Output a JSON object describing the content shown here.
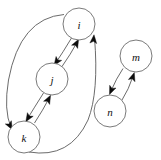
{
  "figure": {
    "kind": "directed-graph",
    "background_color": "#ffffff",
    "edge_color": "#5a5a5a",
    "arrow_color": "#0d0d0d",
    "node_fill": "#ffffff",
    "node_stroke": "#6b6b6b",
    "label_color": "#111111",
    "node_radius": 16
  },
  "nodes": [
    {
      "id": "i",
      "label": "i",
      "cx": 79,
      "cy": 24,
      "r": 16,
      "component": 1
    },
    {
      "id": "j",
      "label": "j",
      "cx": 52,
      "cy": 79,
      "r": 16,
      "component": 1
    },
    {
      "id": "k",
      "label": "k",
      "cx": 24,
      "cy": 137,
      "r": 16,
      "component": 1
    },
    {
      "id": "m",
      "label": "m",
      "cx": 136,
      "cy": 56,
      "r": 16,
      "component": 2
    },
    {
      "id": "n",
      "label": "n",
      "cx": 110,
      "cy": 111,
      "r": 16,
      "component": 2
    }
  ],
  "edges": [
    {
      "id": "i-j",
      "from": "i",
      "to": "j",
      "directed": true,
      "path": "M 71.5 38.0 Q 62.5 53.0 55.5 63.2",
      "arrow": {
        "x": 54.0,
        "y": 65.4,
        "angle": 125
      }
    },
    {
      "id": "j-i",
      "from": "j",
      "to": "i",
      "directed": true,
      "path": "M 62.0 66.5 Q 70.5 54.5 77.5 41.5",
      "arrow": {
        "x": 78.6,
        "y": 39.3,
        "angle": -62
      }
    },
    {
      "id": "j-k",
      "from": "j",
      "to": "k",
      "directed": true,
      "path": "M 43.5 93.0 Q 34.0 108.0 27.0 119.5",
      "arrow": {
        "x": 25.8,
        "y": 121.7,
        "angle": 122
      }
    },
    {
      "id": "k-j",
      "from": "k",
      "to": "j",
      "directed": true,
      "path": "M 34.5 123.0 Q 43.0 110.0 49.5 97.5",
      "arrow": {
        "x": 50.6,
        "y": 95.3,
        "angle": -62
      }
    },
    {
      "id": "i-k",
      "from": "i",
      "to": "k",
      "directed": true,
      "path": "M 64.0 14.5 Q 20.0 18.0 8.5 80.0 Q 3.5 110.0 11.0 127.5",
      "arrow": {
        "x": 12.3,
        "y": 129.8,
        "angle": 62
      }
    },
    {
      "id": "k-i",
      "from": "k",
      "to": "i",
      "directed": true,
      "path": "M 29.0 152.0 Q 70.0 159.0 88.0 120.0 Q 99.0 92.0 94.5 37.5",
      "arrow": {
        "x": 94.0,
        "y": 34.8,
        "angle": -85
      }
    },
    {
      "id": "m-n",
      "from": "m",
      "to": "n",
      "directed": true,
      "path": "M 123.0 68.5 Q 116.5 78.0 110.5 92.0",
      "arrow": {
        "x": 109.5,
        "y": 94.5,
        "angle": 113
      }
    },
    {
      "id": "n-m",
      "from": "n",
      "to": "m",
      "directed": true,
      "path": "M 122.0 100.0 Q 128.5 90.0 133.5 75.0",
      "arrow": {
        "x": 134.3,
        "y": 72.5,
        "angle": -72
      }
    }
  ]
}
